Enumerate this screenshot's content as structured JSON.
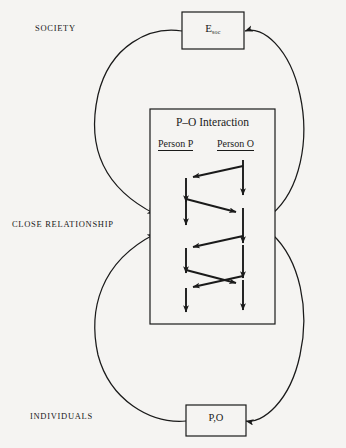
{
  "diagram": {
    "title_labels": {
      "society": "SOCIETY",
      "close_relationship": "CLOSE RELATIONSHIP",
      "individuals": "INDIVIDUALS"
    },
    "boxes": {
      "top": {
        "label_main": "E",
        "label_sub": "soc",
        "name": "E soc"
      },
      "middle": {
        "title": "P–O Interaction",
        "column_p": "Person P",
        "column_o": "Person O"
      },
      "bottom": {
        "label": "P,O"
      }
    },
    "colors": {
      "background": "#f5f4f2",
      "stroke": "#1a1a1a",
      "box_fill": "#f5f4f2",
      "text": "#1a1a1a"
    },
    "structure": {
      "loops": [
        "top-box-left to middle-box-left (downward arc, arrow into middle box)",
        "middle-box-right to top-box-right (upward arc, arrow into top box)",
        "bottom-box-left to middle-box-left (upward arc, arrow into middle box)",
        "middle-box-right to bottom-box-right (downward arc, arrow into bottom box)"
      ],
      "interaction_arrows": "alternating zigzag between Person P and Person O columns with vertical down-arrows in each column"
    }
  }
}
